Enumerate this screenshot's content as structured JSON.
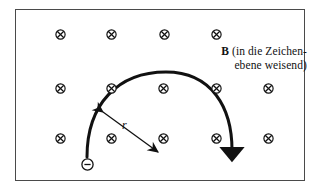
{
  "figure": {
    "background_color": "#ffffff",
    "ink_color": "#111111",
    "frame_color": "#4a4a4a",
    "frame": {
      "x": 15,
      "y": 9,
      "width": 290,
      "height": 172
    }
  },
  "labels": {
    "b_field": {
      "vector_symbol": "B",
      "description_line_1": " (in die Zeichen-",
      "description_line_2": "ebene weisend)",
      "full_text": "B (in die Zeichenebene weisend)"
    },
    "radius": {
      "symbol": "r"
    }
  },
  "field_symbols": {
    "icon_name": "field-into-page-icon",
    "description": "circle with inscribed cross, magnetic field directed into the page",
    "count": 14,
    "radius": 5,
    "positions": [
      {
        "x": 60,
        "y": 34
      },
      {
        "x": 111,
        "y": 34
      },
      {
        "x": 164,
        "y": 34
      },
      {
        "x": 216,
        "y": 34
      },
      {
        "x": 60,
        "y": 88
      },
      {
        "x": 111,
        "y": 88
      },
      {
        "x": 163,
        "y": 88
      },
      {
        "x": 216,
        "y": 88
      },
      {
        "x": 268,
        "y": 88
      },
      {
        "x": 60,
        "y": 138
      },
      {
        "x": 111,
        "y": 138
      },
      {
        "x": 163,
        "y": 138
      },
      {
        "x": 216,
        "y": 138
      },
      {
        "x": 268,
        "y": 138
      }
    ]
  },
  "charge": {
    "icon_name": "negative-charge-icon",
    "sign": "−",
    "x": 87,
    "y": 164,
    "radius": 6
  },
  "trajectory": {
    "icon_name": "trajectory-arc-arrow",
    "description": "semicircular particle path curving clockwise from the charge up over the top and down to the right, ending in an arrowhead",
    "start": {
      "x": 87,
      "y": 157
    },
    "apex": {
      "x": 165,
      "y": 72
    },
    "end": {
      "x": 232,
      "y": 152
    },
    "arrowhead_tip": {
      "x": 233,
      "y": 163
    },
    "stroke_width": 3
  },
  "radius_arrow": {
    "icon_name": "radius-double-arrow",
    "description": "double-headed arrow marking the radius r of the circular path",
    "tail_tip": {
      "x": 101,
      "y": 110
    },
    "head_tip": {
      "x": 160,
      "y": 154
    },
    "label_position": {
      "x": 128,
      "y": 126
    },
    "stroke_width": 1.2
  }
}
